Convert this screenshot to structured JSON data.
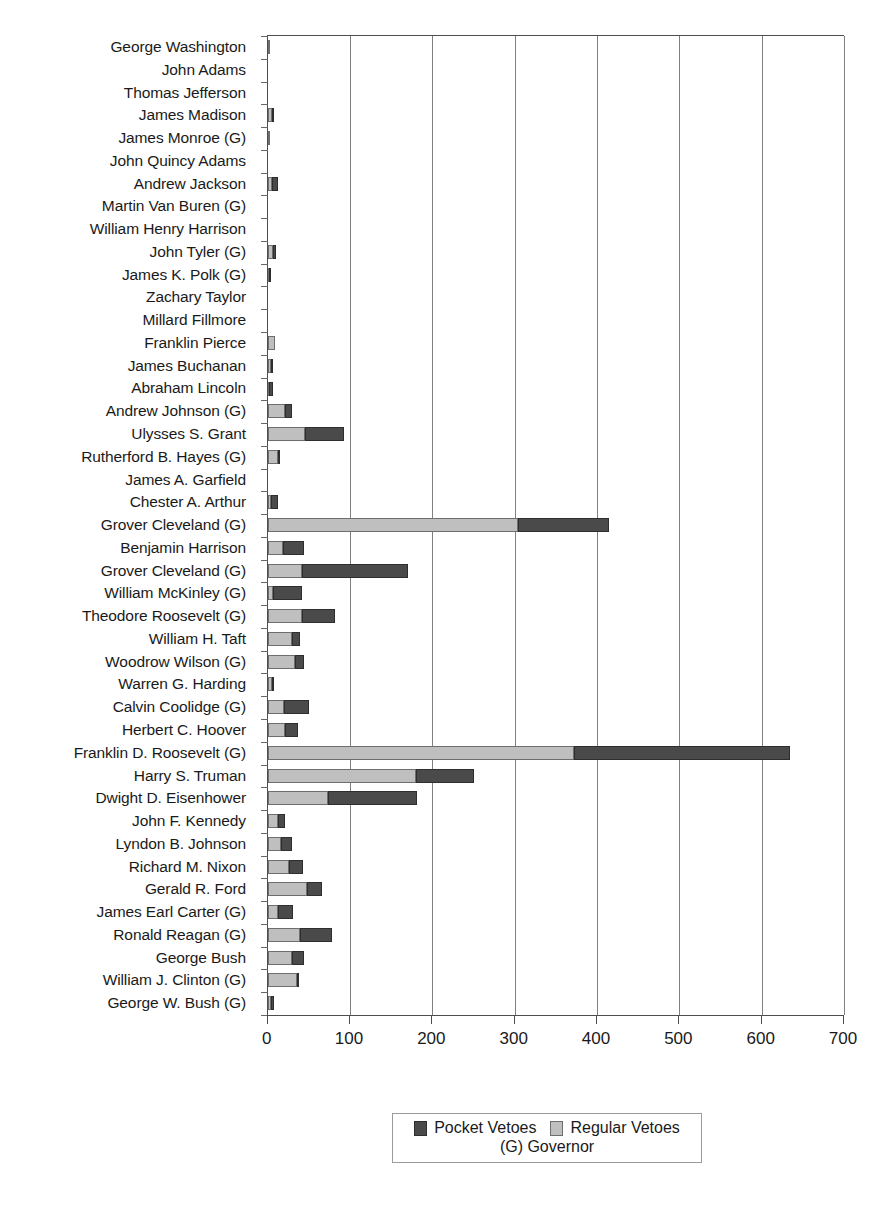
{
  "chart_data": {
    "type": "bar",
    "orientation": "horizontal",
    "stacked": true,
    "title": "",
    "subtitle": "",
    "xlabel": "",
    "ylabel": "",
    "xlim": [
      0,
      700
    ],
    "xticks": [
      0,
      100,
      200,
      300,
      400,
      500,
      600,
      700
    ],
    "xticklabels": [
      "0",
      "100",
      "200",
      "300",
      "400",
      "500",
      "600",
      "700"
    ],
    "grid": "vertical",
    "legend_position": "bottom-center",
    "legend_note": "(G) Governor",
    "series": [
      {
        "name": "Regular Vetoes",
        "color": "#bfbfbf",
        "values": [
          2,
          0,
          0,
          5,
          1,
          0,
          5,
          0,
          0,
          6,
          2,
          0,
          0,
          9,
          4,
          2,
          21,
          45,
          12,
          0,
          4,
          304,
          19,
          42,
          6,
          42,
          30,
          33,
          5,
          20,
          21,
          372,
          180,
          73,
          12,
          16,
          26,
          48,
          13,
          39,
          29,
          36,
          4
        ],
        "label": "Regular Vetoes"
      },
      {
        "name": "Pocket Vetoes",
        "color": "#4a4a4a",
        "values": [
          0,
          0,
          0,
          2,
          0,
          0,
          7,
          0,
          0,
          4,
          1,
          0,
          0,
          0,
          3,
          5,
          8,
          48,
          1,
          0,
          8,
          110,
          25,
          128,
          36,
          40,
          9,
          11,
          1,
          30,
          16,
          263,
          70,
          108,
          9,
          14,
          17,
          18,
          18,
          39,
          15,
          1,
          4
        ],
        "label": "Pocket Vetoes"
      }
    ],
    "categories": [
      "George Washington",
      "John Adams",
      "Thomas Jefferson",
      "James Madison",
      "James Monroe (G)",
      "John Quincy Adams",
      "Andrew Jackson",
      "Martin Van Buren (G)",
      "William Henry Harrison",
      "John Tyler (G)",
      "James K. Polk (G)",
      "Zachary Taylor",
      "Millard Fillmore",
      "Franklin Pierce",
      "James Buchanan",
      "Abraham Lincoln",
      "Andrew Johnson (G)",
      "Ulysses S. Grant",
      "Rutherford B. Hayes (G)",
      "James A. Garfield",
      "Chester A. Arthur",
      "Grover Cleveland (G)",
      "Benjamin Harrison",
      "Grover Cleveland (G)",
      "William McKinley (G)",
      "Theodore Roosevelt (G)",
      "William H. Taft",
      "Woodrow Wilson (G)",
      "Warren G. Harding",
      "Calvin Coolidge (G)",
      "Herbert C. Hoover",
      "Franklin D. Roosevelt (G)",
      "Harry S. Truman",
      "Dwight D. Eisenhower",
      "John F. Kennedy",
      "Lyndon B. Johnson",
      "Richard M. Nixon",
      "Gerald R. Ford",
      "James Earl Carter (G)",
      "Ronald Reagan (G)",
      "George Bush",
      "William J. Clinton (G)",
      "George W. Bush (G)"
    ]
  },
  "legend": {
    "pocket_label": "Pocket Vetoes",
    "regular_label": "Regular Vetoes",
    "note": "(G) Governor"
  },
  "colors": {
    "pocket": "#4a4a4a",
    "regular": "#bfbfbf",
    "axis": "#4d4d4d",
    "grid": "#808080",
    "text": "#1a1a1a",
    "background": "#ffffff"
  }
}
